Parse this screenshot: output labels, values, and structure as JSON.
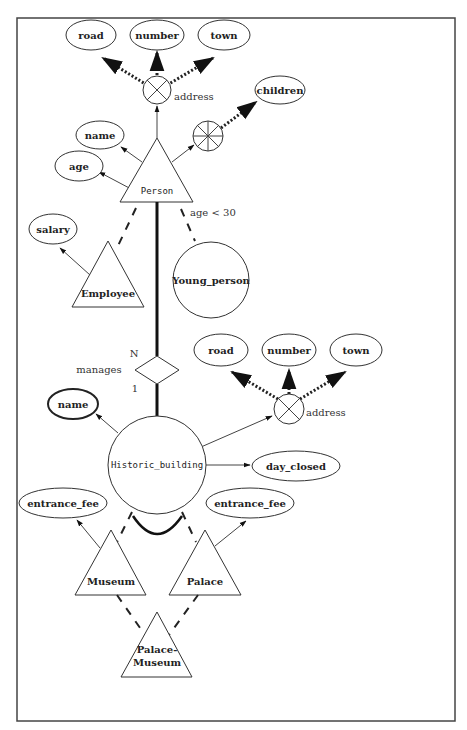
{
  "diagram": {
    "type": "entity-relationship",
    "entities": {
      "person": "Person",
      "employee": "Employee",
      "young_person": "Young_person",
      "historic_building": "Historic_building",
      "museum": "Museum",
      "palace": "Palace",
      "palace_museum_line1": "Palace-",
      "palace_museum_line2": "Museum"
    },
    "attributes": {
      "person_address_road": "road",
      "person_address_number": "number",
      "person_address_town": "town",
      "person_address": "address",
      "person_children": "children",
      "person_name": "name",
      "person_age": "age",
      "employee_salary": "salary",
      "building_name": "name",
      "building_address_road": "road",
      "building_address_number": "number",
      "building_address_town": "town",
      "building_address": "address",
      "building_day_closed": "day_closed",
      "museum_entrance_fee": "entrance_fee",
      "palace_entrance_fee": "entrance_fee"
    },
    "relationship": {
      "name": "manages",
      "card_person": "N",
      "card_building": "1"
    },
    "predicate": "age < 30"
  }
}
